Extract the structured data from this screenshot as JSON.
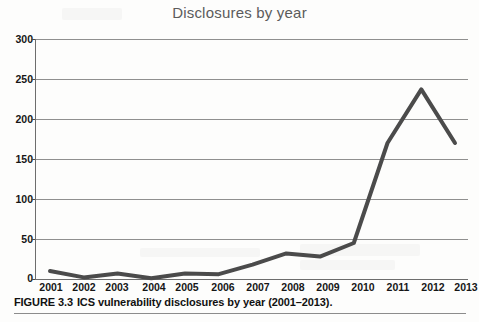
{
  "figure": {
    "title": "Disclosures by year",
    "caption_number": "FIGURE 3.3",
    "caption_text": "ICS vulnerability disclosures by year (2001–2013)."
  },
  "axes": {
    "y_ticks": [
      "0",
      "50",
      "100",
      "150",
      "200",
      "250",
      "300"
    ],
    "x_ticks": [
      "2001",
      "2002",
      "2003",
      "2004",
      "2005",
      "2006",
      "2007",
      "2008",
      "2009",
      "2010",
      "2011",
      "2012",
      "2013"
    ]
  },
  "colors": {
    "line": "#4b4b4b",
    "grid": "#8f8f8f",
    "axis": "#6d6d6d",
    "title": "#5b5b5b",
    "text": "#161616",
    "background": "#fdfdfc"
  },
  "chart_data": {
    "type": "line",
    "title": "Disclosures by year",
    "xlabel": "",
    "ylabel": "",
    "categories": [
      "2001",
      "2002",
      "2003",
      "2004",
      "2005",
      "2006",
      "2007",
      "2008",
      "2009",
      "2010",
      "2011",
      "2012",
      "2013"
    ],
    "values": [
      10,
      2,
      7,
      1,
      7,
      6,
      18,
      32,
      28,
      45,
      170,
      237,
      170
    ],
    "series": [
      {
        "name": "Disclosures",
        "values": [
          10,
          2,
          7,
          1,
          7,
          6,
          18,
          32,
          28,
          45,
          170,
          237,
          170
        ]
      }
    ],
    "ylim": [
      0,
      300
    ],
    "ytick_step": 50,
    "grid": true,
    "legend": false,
    "markers": false,
    "line_width": 4
  }
}
